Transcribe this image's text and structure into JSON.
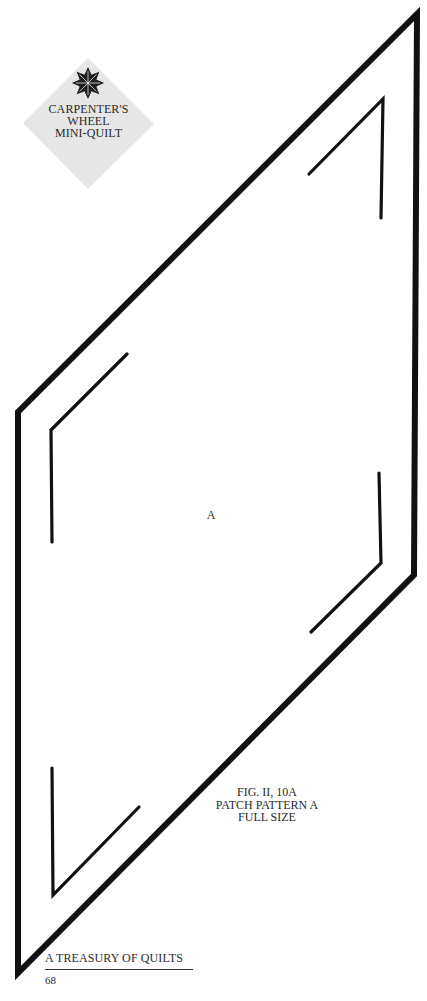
{
  "badge": {
    "lines": [
      "CARPENTER'S",
      "WHEEL",
      "MINI-QUILT"
    ],
    "icon": "eight-point-star-icon",
    "fill_color": "#e6e6e6",
    "star_color": "#1e1e1e"
  },
  "pattern": {
    "patch_letter": "A",
    "outline_color": "#111111",
    "outer_diamond": [
      [
        417,
        14
      ],
      [
        414,
        575
      ],
      [
        18,
        973
      ],
      [
        18,
        412
      ]
    ]
  },
  "caption": {
    "lines": [
      "FIG. II, 10A",
      "PATCH PATTERN A",
      "FULL SIZE"
    ]
  },
  "footer": {
    "book_title": "A TREASURY OF QUILTS",
    "page_number": "68"
  }
}
